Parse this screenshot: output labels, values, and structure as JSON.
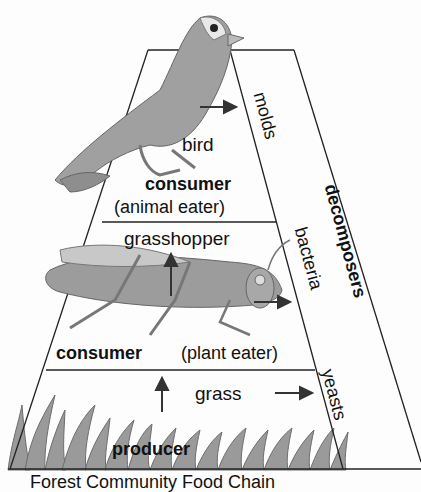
{
  "levels": {
    "top": {
      "organism": "bird",
      "role": "consumer",
      "role_detail": "(animal eater)"
    },
    "middle": {
      "organism": "grasshopper",
      "role": "consumer",
      "role_detail": "(plant eater)"
    },
    "bottom": {
      "organism": "grass",
      "role": "producer"
    }
  },
  "decomposers": {
    "title": "decomposers",
    "items": [
      "molds",
      "bacteria",
      "yeasts"
    ]
  },
  "caption": "Forest Community Food Chain"
}
